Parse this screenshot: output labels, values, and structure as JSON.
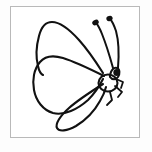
{
  "page": {
    "background_color": "#fdfdfd",
    "width": 152,
    "height": 152
  },
  "frame": {
    "name": "image-border-frame",
    "border_color": "#b9b9b9",
    "fill_color": "#ffffff",
    "x": 10,
    "y": 6,
    "width": 130,
    "height": 132
  },
  "artwork": {
    "title": "Butterfly",
    "subject": "butterfly",
    "style": "black and white line art outline drawing",
    "line_color": "#111111",
    "fill_color": "#ffffff",
    "parts": [
      {
        "id": "upper-wing",
        "label": "Upper forewing",
        "description": "Large teardrop wing sweeping up and to the left from the body"
      },
      {
        "id": "lower-wing",
        "label": "Lower hindwing",
        "description": "Rounded wing below the forewing, pointing left"
      },
      {
        "id": "tail-wing",
        "label": "Narrow tail wing",
        "description": "Slender elongated wing pointing down and to the left"
      },
      {
        "id": "body",
        "label": "Body",
        "description": "Small oval thorax at the right side of the wings"
      },
      {
        "id": "head",
        "label": "Head with eye",
        "description": "Small head with a solid black eye above the body"
      },
      {
        "id": "antenna-left",
        "label": "Left antenna",
        "description": "Curved antenna with a clubbed black tip"
      },
      {
        "id": "antenna-right",
        "label": "Right antenna",
        "description": "Curved antenna with a clubbed black tip"
      },
      {
        "id": "legs",
        "label": "Legs",
        "description": "Three thin jointed legs below and right of the body"
      }
    ]
  }
}
